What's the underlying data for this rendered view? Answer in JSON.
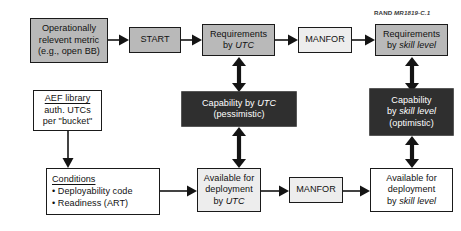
{
  "figure": {
    "credit_prefix": "RAND",
    "credit_id": "MR1819-C.1",
    "accent_gray": "#b9b9b9",
    "accent_dark": "#2f2f2f",
    "accent_light": "#ededed",
    "outline": "#1a1a1a"
  },
  "nodes": {
    "metric": {
      "name": "operationally-relevant-metric",
      "lines": [
        "Operationally",
        "relevent metric",
        "(e.g., open BB)"
      ]
    },
    "start": {
      "name": "start",
      "lines": [
        "START"
      ]
    },
    "req_utc": {
      "name": "requirements-by-utc",
      "lines": [
        "Requirements",
        "by UTC"
      ],
      "italic_line_1": "UTC",
      "prefix_line_1": "by "
    },
    "manfor_top": {
      "name": "manfor-top",
      "lines": [
        "MANFOR"
      ]
    },
    "req_skill": {
      "name": "requirements-by-skill-level",
      "lines": [
        "Requirements",
        "by skill level"
      ],
      "italic_line_1": "skill level",
      "prefix_line_1": "by "
    },
    "cap_utc": {
      "name": "capability-by-utc-pessimistic",
      "lines": [
        "Capability by UTC",
        "(pessimistic)"
      ],
      "line_0_prefix": "Capability by ",
      "line_0_italic": "UTC"
    },
    "cap_skill": {
      "name": "capability-by-skill-level-optimistic",
      "lines": [
        "Capability",
        "by skill level",
        "(optimistic)"
      ],
      "line_1_prefix": "by ",
      "line_1_italic": "skill level"
    },
    "aef": {
      "name": "aef-library",
      "header": "AEF library",
      "lines": [
        "auth. UTCs",
        "per \"bucket\""
      ]
    },
    "conditions": {
      "name": "conditions",
      "header": "Conditions",
      "bullets": [
        "• Deployability code",
        "• Readiness (ART)"
      ]
    },
    "avail_utc": {
      "name": "available-for-deployment-by-utc",
      "lines": [
        "Available for",
        "deployment",
        "by UTC"
      ],
      "line_2_prefix": "by ",
      "line_2_italic": "UTC"
    },
    "manfor_bottom": {
      "name": "manfor-bottom",
      "lines": [
        "MANFOR"
      ]
    },
    "avail_skill": {
      "name": "available-for-deployment-by-skill-level",
      "lines": [
        "Available for",
        "deployment",
        "by skill level"
      ],
      "line_2_prefix": "by ",
      "line_2_italic": "skill level"
    }
  },
  "edges": [
    {
      "name": "arrow-metric-to-start",
      "type": "right"
    },
    {
      "name": "arrow-start-to-req-utc",
      "type": "right"
    },
    {
      "name": "arrow-req-utc-to-manfor-top",
      "type": "right"
    },
    {
      "name": "arrow-manfor-top-to-req-skill",
      "type": "right"
    },
    {
      "name": "arrow-req-utc-cap-utc",
      "type": "double-vertical"
    },
    {
      "name": "arrow-cap-utc-avail-utc",
      "type": "double-vertical"
    },
    {
      "name": "arrow-req-skill-cap-skill",
      "type": "double-vertical"
    },
    {
      "name": "arrow-cap-skill-avail-skill",
      "type": "double-vertical"
    },
    {
      "name": "arrow-aef-to-conditions",
      "type": "down"
    },
    {
      "name": "arrow-conditions-to-avail-utc",
      "type": "right"
    },
    {
      "name": "arrow-avail-utc-to-manfor-bottom",
      "type": "right"
    },
    {
      "name": "arrow-manfor-bottom-to-avail-skill",
      "type": "right"
    }
  ]
}
